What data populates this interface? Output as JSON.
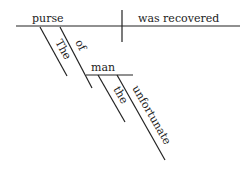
{
  "diagram": {
    "type": "sentence-diagram",
    "subject": "purse",
    "predicate": "was recovered",
    "modifiers": {
      "subject_article": "The",
      "preposition": "of",
      "prep_object": "man",
      "object_article": "the",
      "object_adjective": "unfortunate"
    }
  }
}
